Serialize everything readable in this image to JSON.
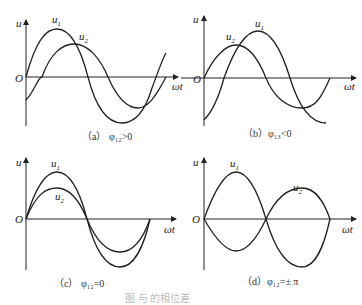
{
  "axis_labels": {
    "y": "u",
    "x": "ωt",
    "origin": "O"
  },
  "panels": [
    {
      "id": "a",
      "caption": "（a）  φ₁₂>0",
      "curves": [
        {
          "name": "u",
          "sub": "1"
        },
        {
          "name": "u",
          "sub": "2"
        }
      ]
    },
    {
      "id": "b",
      "caption": "（b）φ₁₃<0",
      "curves": [
        {
          "name": "u",
          "sub": "1"
        },
        {
          "name": "u",
          "sub": "2"
        }
      ]
    },
    {
      "id": "c",
      "caption": "（c）  φ₁₂=0",
      "curves": [
        {
          "name": "u",
          "sub": "1"
        },
        {
          "name": "u",
          "sub": "2"
        }
      ]
    },
    {
      "id": "d",
      "caption": "（d）φ₁₂=± π",
      "curves": [
        {
          "name": "u",
          "sub": "1"
        },
        {
          "name": "u",
          "sub": "2"
        }
      ]
    }
  ],
  "figure_caption": "图      与      的相位差"
}
